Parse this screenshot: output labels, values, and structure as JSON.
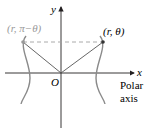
{
  "diagram": {
    "y_axis_label": "y",
    "x_axis_label": "x",
    "origin_label": "O",
    "point_right_label": "(r, θ)",
    "point_left_label": "(r, π−θ)",
    "polar_axis_label_line1": "Polar",
    "polar_axis_label_line2": "axis",
    "colors": {
      "axis": "#231f20",
      "curve": "#8a8a8a",
      "dashed": "#a0a0a0",
      "faded_label": "#9a9a9a"
    }
  }
}
